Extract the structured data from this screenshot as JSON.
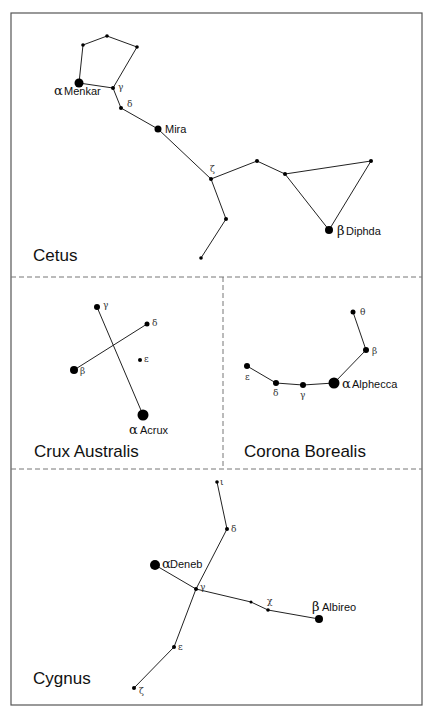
{
  "diagram": {
    "frame": {
      "x": 11,
      "y": 13,
      "w": 411,
      "h": 692
    },
    "dividers": [
      {
        "x1": 11,
        "y1": 277,
        "x2": 422,
        "y2": 277
      },
      {
        "x1": 11,
        "y1": 469,
        "x2": 422,
        "y2": 469
      },
      {
        "x1": 223,
        "y1": 277,
        "x2": 223,
        "y2": 469
      }
    ],
    "panels": [
      {
        "name": "Cetus",
        "title_pos": [
          33,
          261
        ],
        "stars": [
          {
            "id": "alpha",
            "x": 79,
            "y": 83,
            "r": 4.5,
            "greek": "α",
            "name": "Menkar",
            "greek_pos": [
              54,
              95
            ],
            "name_pos": [
              64,
              95
            ],
            "big": true
          },
          {
            "id": "p1",
            "x": 83,
            "y": 45,
            "r": 1.8
          },
          {
            "id": "p2",
            "x": 107,
            "y": 36,
            "r": 1.8
          },
          {
            "id": "p3",
            "x": 137,
            "y": 47,
            "r": 1.8
          },
          {
            "id": "gamma",
            "x": 113,
            "y": 88,
            "r": 2,
            "greek": "γ",
            "greek_pos": [
              118,
              90
            ]
          },
          {
            "id": "delta",
            "x": 121,
            "y": 108,
            "r": 2,
            "greek": "δ",
            "greek_pos": [
              127,
              107
            ]
          },
          {
            "id": "mira",
            "x": 158,
            "y": 129,
            "r": 3.5,
            "name": "Mira",
            "name_pos": [
              165,
              133
            ]
          },
          {
            "id": "zeta",
            "x": 211,
            "y": 179,
            "r": 2,
            "greek": "ζ",
            "greek_pos": [
              210,
              172
            ]
          },
          {
            "id": "c1",
            "x": 257,
            "y": 161,
            "r": 2
          },
          {
            "id": "c2",
            "x": 285,
            "y": 174,
            "r": 2
          },
          {
            "id": "c3",
            "x": 371,
            "y": 161,
            "r": 2
          },
          {
            "id": "beta",
            "x": 329,
            "y": 230,
            "r": 4,
            "greek": "β",
            "name": "Diphda",
            "greek_pos": [
              337,
              235
            ],
            "name_pos": [
              346,
              235
            ],
            "big": true
          },
          {
            "id": "t1",
            "x": 226,
            "y": 219,
            "r": 2
          },
          {
            "id": "t2",
            "x": 201,
            "y": 258,
            "r": 1.8
          }
        ],
        "edges": [
          [
            "alpha",
            "p1"
          ],
          [
            "p1",
            "p2"
          ],
          [
            "p2",
            "p3"
          ],
          [
            "p3",
            "gamma"
          ],
          [
            "alpha",
            "gamma"
          ],
          [
            "gamma",
            "delta"
          ],
          [
            "delta",
            "mira"
          ],
          [
            "mira",
            "zeta"
          ],
          [
            "zeta",
            "c1"
          ],
          [
            "c1",
            "c2"
          ],
          [
            "c2",
            "c3"
          ],
          [
            "c3",
            "beta"
          ],
          [
            "c2",
            "beta"
          ],
          [
            "zeta",
            "t1"
          ],
          [
            "t1",
            "t2"
          ]
        ]
      },
      {
        "name": "Crux Australis",
        "title_pos": [
          34,
          457
        ],
        "stars": [
          {
            "id": "gamma",
            "x": 97,
            "y": 307,
            "r": 3,
            "greek": "γ",
            "greek_pos": [
              103,
              308
            ]
          },
          {
            "id": "delta",
            "x": 147,
            "y": 324,
            "r": 2.5,
            "greek": "δ",
            "greek_pos": [
              152,
              326
            ]
          },
          {
            "id": "beta",
            "x": 74,
            "y": 370,
            "r": 4,
            "greek": "β",
            "greek_pos": [
              80,
              374
            ]
          },
          {
            "id": "epsilon",
            "x": 140,
            "y": 360,
            "r": 2,
            "greek": "ε",
            "greek_pos": [
              144,
              362
            ]
          },
          {
            "id": "alpha",
            "x": 143,
            "y": 415,
            "r": 5.5,
            "greek": "α",
            "name": "Acrux",
            "greek_pos": [
              129,
              434
            ],
            "name_pos": [
              140,
              434
            ],
            "big": true
          }
        ],
        "edges": [
          [
            "gamma",
            "alpha"
          ],
          [
            "beta",
            "delta"
          ]
        ]
      },
      {
        "name": "Corona Borealis",
        "title_pos": [
          244,
          457
        ],
        "stars": [
          {
            "id": "theta",
            "x": 353,
            "y": 312,
            "r": 2.5,
            "greek": "θ",
            "greek_pos": [
              360,
              315
            ]
          },
          {
            "id": "beta",
            "x": 366,
            "y": 350,
            "r": 3,
            "greek": "β",
            "greek_pos": [
              372,
              354
            ]
          },
          {
            "id": "alpha",
            "x": 334,
            "y": 383,
            "r": 5.5,
            "greek": "α",
            "name": "Alphecca",
            "greek_pos": [
              342,
              388
            ],
            "name_pos": [
              352,
              388
            ],
            "big": true
          },
          {
            "id": "gamma",
            "x": 303,
            "y": 385,
            "r": 3,
            "greek": "γ",
            "greek_pos": [
              300,
              398
            ]
          },
          {
            "id": "delta",
            "x": 276,
            "y": 383,
            "r": 3,
            "greek": "δ",
            "greek_pos": [
              273,
              396
            ]
          },
          {
            "id": "epsilon",
            "x": 247,
            "y": 366,
            "r": 3,
            "greek": "ε",
            "greek_pos": [
              245,
              380
            ]
          }
        ],
        "edges": [
          [
            "theta",
            "beta"
          ],
          [
            "beta",
            "alpha"
          ],
          [
            "alpha",
            "gamma"
          ],
          [
            "gamma",
            "delta"
          ],
          [
            "delta",
            "epsilon"
          ]
        ]
      },
      {
        "name": "Cygnus",
        "title_pos": [
          33,
          684
        ],
        "stars": [
          {
            "id": "iota",
            "x": 217,
            "y": 482,
            "r": 1.8,
            "greek": "ι",
            "greek_pos": [
              220,
              485
            ]
          },
          {
            "id": "delta",
            "x": 227,
            "y": 529,
            "r": 2,
            "greek": "δ",
            "greek_pos": [
              231,
              532
            ]
          },
          {
            "id": "alpha",
            "x": 155,
            "y": 565,
            "r": 5,
            "greek": "α",
            "name": "Deneb",
            "greek_pos": [
              162,
              568
            ],
            "name_pos": [
              170,
              568
            ],
            "big": true
          },
          {
            "id": "gamma",
            "x": 196,
            "y": 589,
            "r": 2,
            "greek": "γ",
            "greek_pos": [
              200,
              590
            ]
          },
          {
            "id": "x1",
            "x": 251,
            "y": 602,
            "r": 1.5
          },
          {
            "id": "chi",
            "x": 268,
            "y": 610,
            "r": 1.8,
            "greek": "χ",
            "greek_pos": [
              267,
              604
            ]
          },
          {
            "id": "beta",
            "x": 319,
            "y": 619,
            "r": 4,
            "greek": "β",
            "name": "Albireo",
            "greek_pos": [
              312,
              611
            ],
            "name_pos": [
              322,
              611
            ],
            "big": true
          },
          {
            "id": "epsilon",
            "x": 174,
            "y": 647,
            "r": 2,
            "greek": "ε",
            "greek_pos": [
              178,
              650
            ]
          },
          {
            "id": "zeta",
            "x": 134,
            "y": 688,
            "r": 2,
            "greek": "ζ",
            "greek_pos": [
              139,
              694
            ]
          }
        ],
        "edges": [
          [
            "iota",
            "delta"
          ],
          [
            "delta",
            "gamma"
          ],
          [
            "gamma",
            "epsilon"
          ],
          [
            "epsilon",
            "zeta"
          ],
          [
            "alpha",
            "gamma"
          ],
          [
            "gamma",
            "x1"
          ],
          [
            "x1",
            "chi"
          ],
          [
            "chi",
            "beta"
          ]
        ]
      }
    ]
  }
}
